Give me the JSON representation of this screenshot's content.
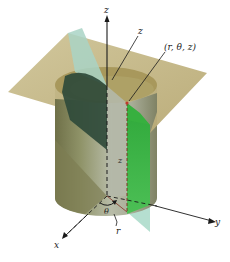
{
  "figure": {
    "labels": {
      "z_axis": "z",
      "z_height_top": "z",
      "point": "(r, θ, z)",
      "z_height_mid": "z",
      "theta": "θ",
      "r": "r",
      "x_axis": "x",
      "y_axis": "y"
    },
    "colors": {
      "horizontal_plane": "#c7b98a",
      "horizontal_plane_dark": "#a99a62",
      "cylinder_outer": "#8c8a60",
      "cylinder_inner_light": "#d8d2b0",
      "cylinder_front": "#b9bca6",
      "half_plane_green": "#3db33d",
      "half_plane_pale": "#a8d9c8",
      "shadow_dark_green": "#2f4a3a",
      "axis": "#1a1a1a",
      "point": "#c0392b"
    }
  }
}
